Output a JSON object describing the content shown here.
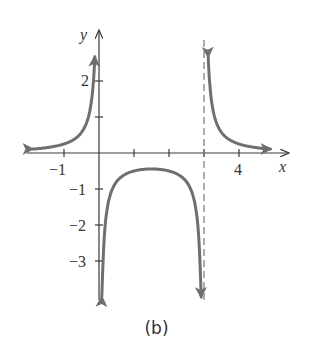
{
  "chart_data": {
    "type": "line",
    "title": "",
    "caption": "(b)",
    "xlabel": "x",
    "ylabel": "y",
    "function": "y = 1/(x(x-3))",
    "xlim": [
      -2,
      5
    ],
    "ylim": [
      -4,
      3.4
    ],
    "x_ticks": [
      -1,
      1,
      2,
      3,
      4
    ],
    "x_tick_labels": [
      {
        "value": -1,
        "label": "−1"
      },
      {
        "value": 4,
        "label": "4"
      }
    ],
    "y_ticks": [
      -3,
      -2,
      -1,
      1,
      2
    ],
    "y_tick_labels": [
      {
        "value": 2,
        "label": "2"
      },
      {
        "value": -1,
        "label": "−1"
      },
      {
        "value": -2,
        "label": "−2"
      },
      {
        "value": -3,
        "label": "−3"
      }
    ],
    "vertical_asymptotes": [
      {
        "x": 3,
        "style": "dashed"
      },
      {
        "x": 0,
        "style": "coincides with y-axis"
      }
    ],
    "horizontal_asymptote": 0,
    "series": [
      {
        "name": "left-branch",
        "x_range": [
          -1.9,
          -0.12
        ],
        "points": [
          [
            -1.9,
            0.11
          ],
          [
            -1,
            0.25
          ],
          [
            -0.5,
            0.57
          ],
          [
            -0.3,
            1.23
          ],
          [
            -0.2,
            1.56
          ],
          [
            -0.12,
            2.9
          ]
        ]
      },
      {
        "name": "middle-branch",
        "x_range": [
          0.08,
          2.92
        ],
        "points": [
          [
            0.1,
            -3.45
          ],
          [
            0.3,
            -1.23
          ],
          [
            0.5,
            -0.8
          ],
          [
            1,
            -0.5
          ],
          [
            1.5,
            -0.44
          ],
          [
            2,
            -0.5
          ],
          [
            2.5,
            -0.8
          ],
          [
            2.7,
            -1.23
          ],
          [
            2.9,
            -3.45
          ]
        ]
      },
      {
        "name": "right-branch",
        "x_range": [
          3.12,
          4.9
        ],
        "points": [
          [
            3.12,
            2.6
          ],
          [
            3.3,
            1.01
          ],
          [
            3.5,
            0.57
          ],
          [
            4,
            0.25
          ],
          [
            4.9,
            0.11
          ]
        ]
      }
    ],
    "grid": false,
    "legend": null
  },
  "labels": {
    "x_axis": "x",
    "y_axis": "y",
    "xt_neg1": "−1",
    "xt_4": "4",
    "yt_2": "2",
    "yt_neg1": "−1",
    "yt_neg2": "−2",
    "yt_neg3": "−3",
    "caption": "(b)"
  },
  "colors": {
    "curve": "#6f6f6f",
    "axis": "#3a3a3a",
    "asymptote": "#777777"
  }
}
